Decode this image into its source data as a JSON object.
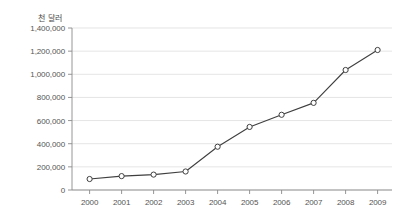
{
  "chart_data": {
    "type": "line",
    "title": "",
    "subtitle": "",
    "xlabel": "",
    "ylabel": "",
    "unit_label": "천 달러",
    "categories": [
      "2000",
      "2001",
      "2002",
      "2003",
      "2004",
      "2005",
      "2006",
      "2007",
      "2008",
      "2009"
    ],
    "x": [
      2000,
      2001,
      2002,
      2003,
      2004,
      2005,
      2006,
      2007,
      2008,
      2009
    ],
    "values": [
      95000,
      120000,
      133000,
      160000,
      374000,
      545000,
      650000,
      753000,
      1037000,
      1210000
    ],
    "series": [
      {
        "name": "",
        "values": [
          95000,
          120000,
          133000,
          160000,
          374000,
          545000,
          650000,
          753000,
          1037000,
          1210000
        ]
      }
    ],
    "ylim": [
      0,
      1400000
    ],
    "ytick_values": [
      0,
      200000,
      400000,
      600000,
      800000,
      1000000,
      1200000,
      1400000
    ],
    "ytick_labels": [
      "0",
      "200,000",
      "400,000",
      "600,000",
      "800,000",
      "1,000,000",
      "1,200,000",
      "1,400,000"
    ],
    "xtick_labels": [
      "2000",
      "2001",
      "2002",
      "2003",
      "2004",
      "2005",
      "2006",
      "2007",
      "2008",
      "2009"
    ],
    "grid": true,
    "grid_axis": "y",
    "legend": false,
    "legend_position": "none",
    "marker": "open-circle",
    "colors": {
      "line": "#3f3f3f",
      "marker_fill": "#ffffff",
      "marker_stroke": "#3f3f3f",
      "grid": "#d9d9d9",
      "axis": "#8a8a8a",
      "text": "#555555",
      "background": "#ffffff"
    }
  }
}
